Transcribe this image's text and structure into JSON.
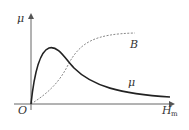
{
  "diagram": {
    "axes": {
      "y_label": "μ",
      "x_label": "H",
      "x_label_subscript": "m",
      "origin_label": "O"
    },
    "curves": [
      {
        "name": "B",
        "label": "B",
        "style": "dashed",
        "color": "#888888"
      },
      {
        "name": "mu",
        "label": "μ",
        "style": "solid",
        "color": "#222222"
      }
    ]
  }
}
